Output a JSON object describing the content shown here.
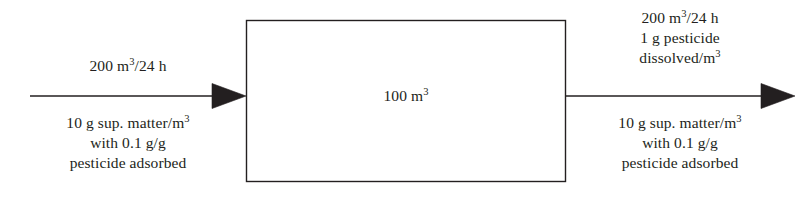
{
  "diagram": {
    "stroke_color": "#231f20",
    "text_color": "#231f20",
    "background_color": "#ffffff"
  },
  "vessel": {
    "label_value": "100",
    "label_unit": "m",
    "label_exponent": "3",
    "label_full": "100 m3"
  },
  "inlet": {
    "arrow_name": "influent-arrow",
    "flow_value": "200",
    "flow_unit": "m",
    "flow_exponent": "3",
    "flow_per": "/24 h",
    "flow_full": "200 m3/24 h",
    "solids_line1_a": "10 g sup. matter/m",
    "solids_line1_exponent": "3",
    "solids_line2": "with 0.1 g/g",
    "solids_line3": "pesticide adsorbed",
    "solids_full": "10 g sup. matter/m3 with 0.1 g/g pesticide adsorbed"
  },
  "outlet": {
    "arrow_name": "effluent-arrow",
    "flow_value": "200",
    "flow_unit": "m",
    "flow_exponent": "3",
    "flow_per": "/24 h",
    "flow_full": "200 m3/24 h",
    "dissolved_line1": "1 g pesticide",
    "dissolved_line2_a": "dissolved/m",
    "dissolved_line2_exponent": "3",
    "dissolved_full": "1 g pesticide dissolved/m3",
    "solids_line1_a": "10 g sup. matter/m",
    "solids_line1_exponent": "3",
    "solids_line2": "with 0.1 g/g",
    "solids_line3": "pesticide adsorbed",
    "solids_full": "10 g sup. matter/m3 with 0.1 g/g pesticide adsorbed"
  }
}
